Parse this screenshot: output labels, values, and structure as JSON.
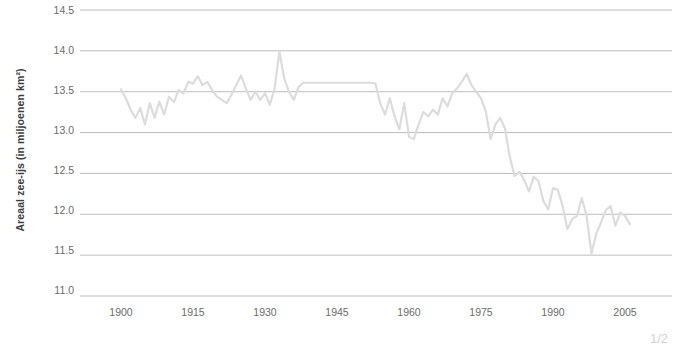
{
  "chart_data": {
    "type": "line",
    "title": "",
    "xlabel": "",
    "ylabel": "Areaal zee-ijs (in miljoenen km²)",
    "xlim": [
      1898,
      2008
    ],
    "ylim": [
      11.0,
      14.5
    ],
    "xticks": [
      1900,
      1915,
      1930,
      1945,
      1960,
      1975,
      1990,
      2005
    ],
    "yticks": [
      "11.0",
      "11.5",
      "12.0",
      "12.5",
      "13.0",
      "13.5",
      "14.0",
      "14.5"
    ],
    "grid": true,
    "legend": "none",
    "series": [
      {
        "name": "Areaal zee-ijs",
        "color": "#dcdcdc",
        "x": [
          1900,
          1901,
          1902,
          1903,
          1904,
          1905,
          1906,
          1907,
          1908,
          1909,
          1910,
          1911,
          1912,
          1913,
          1914,
          1915,
          1916,
          1917,
          1918,
          1919,
          1920,
          1921,
          1922,
          1923,
          1924,
          1925,
          1926,
          1927,
          1928,
          1929,
          1930,
          1931,
          1932,
          1933,
          1934,
          1935,
          1936,
          1937,
          1938,
          1939,
          1940,
          1941,
          1942,
          1943,
          1944,
          1945,
          1946,
          1947,
          1948,
          1949,
          1950,
          1951,
          1952,
          1953,
          1954,
          1955,
          1956,
          1957,
          1958,
          1959,
          1960,
          1961,
          1962,
          1963,
          1964,
          1965,
          1966,
          1967,
          1968,
          1969,
          1970,
          1971,
          1972,
          1973,
          1974,
          1975,
          1976,
          1977,
          1978,
          1979,
          1980,
          1981,
          1982,
          1983,
          1984,
          1985,
          1986,
          1987,
          1988,
          1989,
          1990,
          1991,
          1992,
          1993,
          1994,
          1995,
          1996,
          1997,
          1998,
          1999,
          2000,
          2001,
          2002,
          2003,
          2004,
          2005,
          2006
        ],
        "y": [
          13.53,
          13.42,
          13.28,
          13.18,
          13.3,
          13.1,
          13.36,
          13.18,
          13.38,
          13.22,
          13.44,
          13.37,
          13.52,
          13.48,
          13.62,
          13.6,
          13.69,
          13.58,
          13.62,
          13.52,
          13.44,
          13.4,
          13.36,
          13.46,
          13.58,
          13.7,
          13.54,
          13.4,
          13.5,
          13.4,
          13.48,
          13.34,
          13.54,
          13.99,
          13.66,
          13.5,
          13.4,
          13.56,
          13.61,
          13.61,
          13.61,
          13.61,
          13.61,
          13.61,
          13.61,
          13.61,
          13.61,
          13.61,
          13.61,
          13.61,
          13.61,
          13.61,
          13.61,
          13.6,
          13.36,
          13.22,
          13.42,
          13.2,
          13.04,
          13.36,
          12.95,
          12.92,
          13.1,
          13.25,
          13.2,
          13.28,
          13.22,
          13.42,
          13.32,
          13.48,
          13.54,
          13.62,
          13.72,
          13.58,
          13.5,
          13.42,
          13.26,
          12.92,
          13.1,
          13.18,
          13.05,
          12.7,
          12.47,
          12.52,
          12.42,
          12.28,
          12.46,
          12.4,
          12.16,
          12.06,
          12.32,
          12.3,
          12.1,
          11.82,
          11.94,
          11.98,
          12.2,
          11.98,
          11.52,
          11.76,
          11.9,
          12.05,
          12.1,
          11.86,
          12.02,
          11.98,
          11.88
        ]
      }
    ]
  },
  "axis": {
    "y_tick_labels": [
      "14.5",
      "14.0",
      "13.5",
      "13.0",
      "12.5",
      "12.0",
      "11.5",
      "11.0"
    ],
    "x_tick_labels": [
      "1900",
      "1915",
      "1930",
      "1945",
      "1960",
      "1975",
      "1990",
      "2005"
    ]
  },
  "footer": {
    "left_note": "",
    "page_number": "1/2"
  },
  "colors": {
    "gridline": "#b5b5b5",
    "series_line": "#dcdcdc",
    "tick_text": "#6b6b6b",
    "axis_title": "#3d3d3d",
    "background": "#ffffff"
  }
}
